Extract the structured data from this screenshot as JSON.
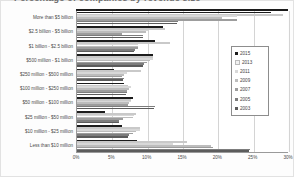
{
  "title": "Percentage of companies by revenue size",
  "legend": {
    "position": "right",
    "items": [
      {
        "label": "2015",
        "color": "#1c1c1c"
      },
      {
        "label": "2013",
        "color": "#f2f2f2"
      },
      {
        "label": "2011",
        "color": "#d8d8d8"
      },
      {
        "label": "2009",
        "color": "#bdbdbd"
      },
      {
        "label": "2007",
        "color": "#9d9d9d"
      },
      {
        "label": "2005",
        "color": "#7d7d7d"
      },
      {
        "label": "2003",
        "color": "#5c5c5c"
      }
    ]
  },
  "axis": {
    "x_ticks": [
      "0%",
      "5%",
      "10%",
      "15%",
      "20%",
      "25%",
      "30%"
    ],
    "x_min": 0,
    "x_max": 30,
    "x_label": "",
    "y_label": ""
  },
  "chart_data": {
    "type": "bar",
    "title": "Percentage of companies by revenue size",
    "xlabel": "",
    "ylabel": "",
    "xlim": [
      0,
      30
    ],
    "grid": true,
    "orientation": "horizontal",
    "legend_position": "right",
    "categories": [
      "More than $5 billion",
      "$2.5 billion - $5 billion",
      "$1 billion - $2.5 billion",
      "$500 million - $1 billion",
      "$250 million - $500 million",
      "$100 million - $250 million",
      "$50 million - $100 million",
      "$25 million - $50 million",
      "$10 million - $25 million",
      "Less than $10 million"
    ],
    "series": [
      {
        "name": "2015",
        "color": "#1c1c1c",
        "values": [
          27.4,
          12.1,
          11.1,
          10.7,
          5.3,
          6.7,
          7.9,
          4.0,
          6.4,
          8.5
        ]
      },
      {
        "name": "2013",
        "color": "#f2f2f2",
        "values": [
          29.1,
          12.5,
          13.2,
          10.8,
          9.0,
          7.2,
          7.7,
          8.4,
          8.9,
          15.5
        ]
      },
      {
        "name": "2011",
        "color": "#d8d8d8",
        "values": [
          22.7,
          10.0,
          8.7,
          10.8,
          7.1,
          7.6,
          7.6,
          8.1,
          8.9,
          13.6
        ]
      },
      {
        "name": "2009",
        "color": "#bdbdbd",
        "values": [
          20.5,
          9.8,
          8.6,
          10.3,
          6.6,
          7.3,
          7.4,
          7.9,
          8.3,
          19.0
        ]
      },
      {
        "name": "2007",
        "color": "#9d9d9d",
        "values": [
          22.6,
          6.3,
          8.6,
          9.9,
          6.3,
          7.1,
          7.2,
          6.5,
          7.9,
          19.3
        ]
      },
      {
        "name": "2005",
        "color": "#7d7d7d",
        "values": [
          14.3,
          9.4,
          8.2,
          9.5,
          6.6,
          7.1,
          11.0,
          6.0,
          7.3,
          24.5
        ]
      },
      {
        "name": "2003",
        "color": "#5c5c5c",
        "values": [
          14.2,
          9.3,
          8.1,
          9.4,
          6.5,
          7.0,
          10.9,
          5.9,
          7.2,
          24.4
        ]
      }
    ]
  }
}
